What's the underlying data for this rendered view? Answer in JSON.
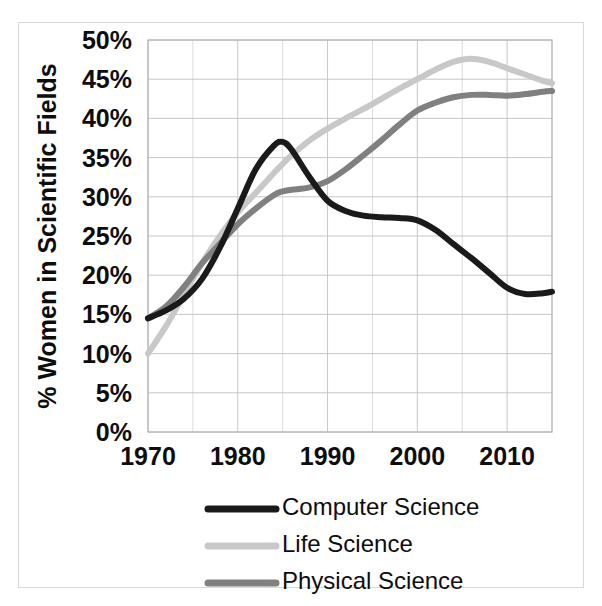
{
  "figure": {
    "background_color": "#ffffff",
    "frame_color": "#d9d9d9"
  },
  "chart_data": {
    "type": "line",
    "title": "",
    "subtitle": "",
    "xlabel": "",
    "ylabel": "% Women in Scientific Fields",
    "xlim": [
      1970,
      2015
    ],
    "ylim": [
      0,
      50
    ],
    "xticks": [
      1970,
      1980,
      1990,
      2000,
      2010
    ],
    "xtick_labels": [
      "1970",
      "1980",
      "1990",
      "2000",
      "2010"
    ],
    "yticks": [
      0,
      5,
      10,
      15,
      20,
      25,
      30,
      35,
      40,
      45,
      50
    ],
    "ytick_labels": [
      "0%",
      "5%",
      "10%",
      "15%",
      "20%",
      "25%",
      "30%",
      "35%",
      "40%",
      "45%",
      "50%"
    ],
    "grid": true,
    "grid_minor_x_step": 5,
    "legend_position": "bottom",
    "x": [
      1970,
      1972,
      1974,
      1976,
      1978,
      1980,
      1982,
      1984,
      1985,
      1986,
      1988,
      1990,
      1992,
      1994,
      1996,
      1998,
      2000,
      2002,
      2004,
      2006,
      2008,
      2010,
      2012,
      2014,
      2015
    ],
    "series": [
      {
        "name": "Computer Science",
        "color": "#1a1a1a",
        "line_width": 6,
        "values": [
          14.5,
          15.5,
          17.0,
          19.5,
          23.5,
          28.5,
          33.5,
          36.5,
          37.0,
          36.0,
          32.5,
          29.5,
          28.2,
          27.6,
          27.4,
          27.3,
          27.0,
          25.8,
          24.0,
          22.2,
          20.3,
          18.4,
          17.6,
          17.7,
          17.9
        ]
      },
      {
        "name": "Life Science",
        "color": "#c8c8c8",
        "line_width": 6,
        "values": [
          10.0,
          13.5,
          17.5,
          21.5,
          25.0,
          28.0,
          30.5,
          33.0,
          34.2,
          35.3,
          37.2,
          38.7,
          40.0,
          41.2,
          42.5,
          43.8,
          45.0,
          46.2,
          47.2,
          47.6,
          47.2,
          46.4,
          45.6,
          44.8,
          44.5
        ]
      },
      {
        "name": "Physical Science",
        "color": "#808080",
        "line_width": 6,
        "values": [
          14.5,
          16.0,
          18.5,
          21.5,
          24.0,
          26.5,
          28.5,
          30.2,
          30.7,
          30.9,
          31.2,
          32.0,
          33.5,
          35.3,
          37.2,
          39.2,
          41.0,
          42.0,
          42.7,
          43.0,
          43.0,
          42.9,
          43.1,
          43.4,
          43.5
        ]
      }
    ]
  },
  "legend": {
    "items": [
      {
        "label": "Computer Science",
        "color": "#1a1a1a"
      },
      {
        "label": "Life Science",
        "color": "#c8c8c8"
      },
      {
        "label": "Physical Science",
        "color": "#808080"
      }
    ]
  }
}
